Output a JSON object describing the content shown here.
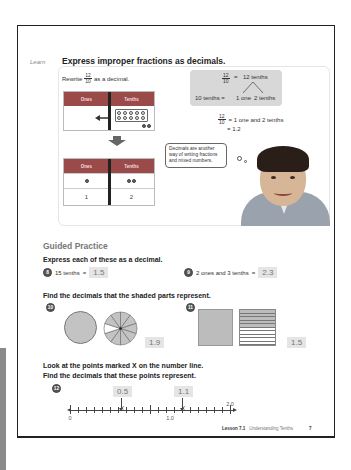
{
  "side_tab_color": "#8a8a8a",
  "learn": {
    "tag": "Learn",
    "title": "Express improper fractions as decimals.",
    "rewrite_prefix": "Rewrite",
    "rewrite_fraction": {
      "numerator": "12",
      "denominator": "10"
    },
    "rewrite_suffix": "as a decimal.",
    "table_top": {
      "headers": [
        "Ones",
        "Tenths"
      ],
      "tenths_dots_full": 10,
      "tenths_dots_extra": 2
    },
    "table_bottom": {
      "headers": [
        "Ones",
        "Tenths"
      ],
      "dot_row": {
        "ones": 1,
        "tenths": 2
      },
      "digit_row": [
        "1",
        "2"
      ]
    },
    "header_color": "#9b4a4a",
    "number_bond": {
      "fraction": {
        "numerator": "12",
        "denominator": "10"
      },
      "equals": "=",
      "top": "12 tenths",
      "left": "10 tenths =",
      "branch_left": "1 one",
      "branch_right": "2 tenths"
    },
    "calc": {
      "fraction": {
        "numerator": "12",
        "denominator": "10"
      },
      "line1": "= 1 one and 2 tenths",
      "line2": "= 1.2"
    },
    "speech_bubble": "Decimals are another way of writing fractions and mixed numbers."
  },
  "guided_practice": {
    "title": "Guided Practice",
    "instruction_1": "Express each of these as a decimal.",
    "q8": {
      "num": "8",
      "text": "15 tenths",
      "equals": "=",
      "answer": "1.5"
    },
    "q9": {
      "num": "9",
      "text": "2 ones and 3 tenths",
      "equals": "=",
      "answer": "2.3"
    },
    "instruction_2": "Find the decimals that the shaded parts represent.",
    "q10": {
      "num": "10",
      "whole_circles": 1,
      "sector_shaded": 9,
      "sector_total": 10,
      "answer": "1.9"
    },
    "q11": {
      "num": "11",
      "whole_squares": 1,
      "stripes_shaded": 5,
      "stripes_total": 10,
      "answer": "1.5"
    },
    "instruction_3": "Look at the points marked X on the number line.",
    "instruction_4": "Find the decimals that these points represent.",
    "q12": {
      "num": "12",
      "labels": [
        "0",
        "1.0",
        "2.0"
      ],
      "mark": "X",
      "points": [
        {
          "value": 0.5,
          "answer": "0.5"
        },
        {
          "value": 1.1,
          "answer": "1.1"
        }
      ]
    }
  },
  "footer": {
    "lesson": "Lesson 7.1",
    "lesson_title": "Understanding Tenths",
    "page_number": "7"
  }
}
